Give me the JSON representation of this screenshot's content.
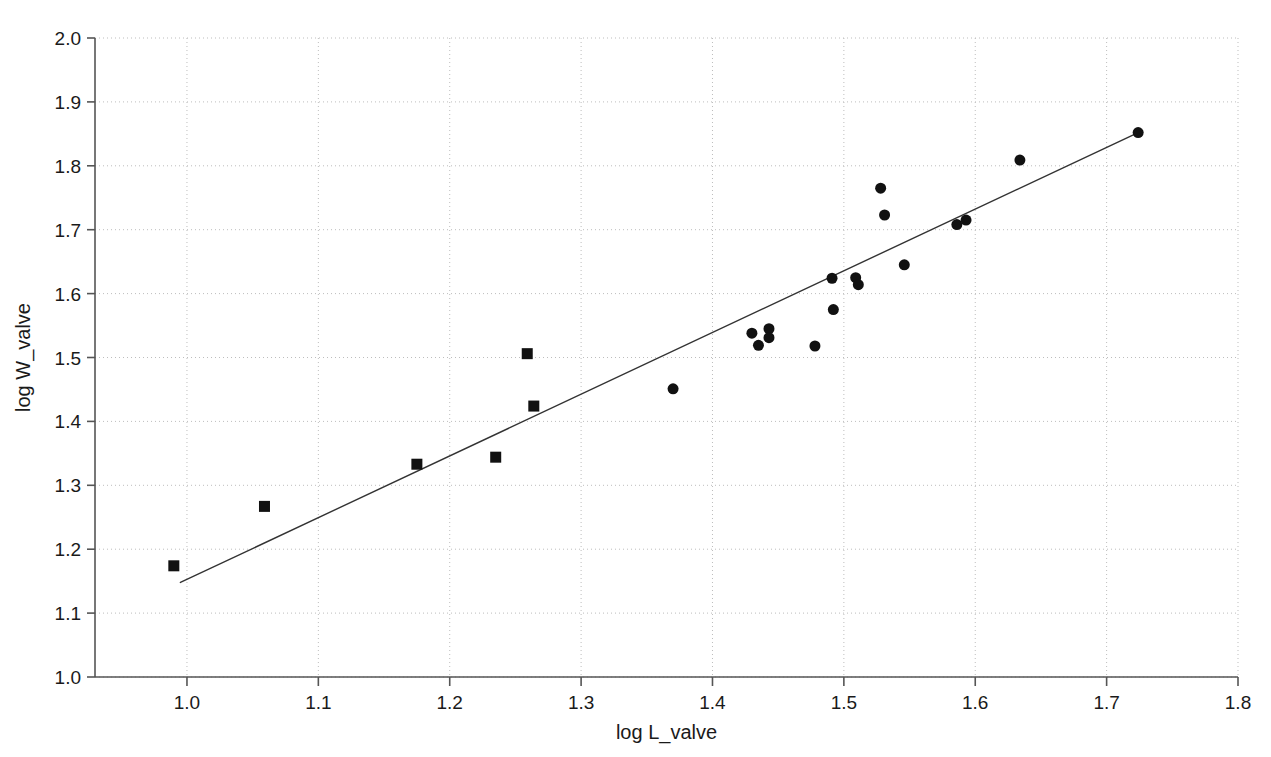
{
  "chart_data": {
    "type": "scatter",
    "title": "",
    "xlabel": "log L_valve",
    "ylabel": "log W_valve",
    "xlim": [
      0.93,
      1.8
    ],
    "ylim": [
      1.0,
      2.0
    ],
    "grid": true,
    "grid_style": "dotted",
    "legend_position": "none",
    "xticks": [
      "1.0",
      "1.1",
      "1.2",
      "1.3",
      "1.4",
      "1.5",
      "1.6",
      "1.7",
      "1.8"
    ],
    "xtick_values": [
      1.0,
      1.1,
      1.2,
      1.3,
      1.4,
      1.5,
      1.6,
      1.7,
      1.8
    ],
    "yticks": [
      "1.0",
      "1.1",
      "1.2",
      "1.3",
      "1.4",
      "1.5",
      "1.6",
      "1.7",
      "1.8",
      "1.9",
      "2.0"
    ],
    "ytick_values": [
      1.0,
      1.1,
      1.2,
      1.3,
      1.4,
      1.5,
      1.6,
      1.7,
      1.8,
      1.9,
      2.0
    ],
    "series": [
      {
        "name": "square-group",
        "marker": "square",
        "color": "#111111",
        "size": 11,
        "points": [
          {
            "x": 0.99,
            "y": 1.174
          },
          {
            "x": 1.059,
            "y": 1.267
          },
          {
            "x": 1.175,
            "y": 1.333
          },
          {
            "x": 1.235,
            "y": 1.344
          },
          {
            "x": 1.259,
            "y": 1.506
          },
          {
            "x": 1.264,
            "y": 1.424
          }
        ]
      },
      {
        "name": "circle-group",
        "marker": "circle",
        "color": "#111111",
        "size": 11,
        "points": [
          {
            "x": 1.37,
            "y": 1.451
          },
          {
            "x": 1.43,
            "y": 1.538
          },
          {
            "x": 1.435,
            "y": 1.519
          },
          {
            "x": 1.443,
            "y": 1.545
          },
          {
            "x": 1.443,
            "y": 1.531
          },
          {
            "x": 1.478,
            "y": 1.518
          },
          {
            "x": 1.491,
            "y": 1.624
          },
          {
            "x": 1.492,
            "y": 1.575
          },
          {
            "x": 1.509,
            "y": 1.625
          },
          {
            "x": 1.511,
            "y": 1.614
          },
          {
            "x": 1.528,
            "y": 1.765
          },
          {
            "x": 1.531,
            "y": 1.723
          },
          {
            "x": 1.546,
            "y": 1.645
          },
          {
            "x": 1.586,
            "y": 1.708
          },
          {
            "x": 1.593,
            "y": 1.715
          },
          {
            "x": 1.634,
            "y": 1.809
          },
          {
            "x": 1.724,
            "y": 1.852
          }
        ]
      }
    ],
    "fit_line": {
      "name": "regression-line",
      "color": "#333333",
      "width": 1.4,
      "x_start": 0.995,
      "y_start": 1.148,
      "x_end": 1.724,
      "y_end": 1.852
    }
  },
  "axes": {
    "x_axis_name": "log L_valve",
    "y_axis_name": "log W_valve"
  }
}
